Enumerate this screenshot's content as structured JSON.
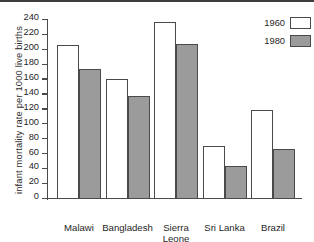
{
  "chart_data": {
    "type": "bar",
    "title": "",
    "xlabel": "",
    "ylabel": "infant mortality rate per 1000 live births",
    "ylim": [
      0,
      240
    ],
    "yticks": [
      0,
      20,
      40,
      60,
      80,
      100,
      120,
      140,
      160,
      180,
      200,
      220,
      240
    ],
    "grid": false,
    "legend_position": "top-right",
    "categories": [
      "Malawi",
      "Bangladesh",
      "Sierra\nLeone",
      "Sri Lanka",
      "Brazil"
    ],
    "series": [
      {
        "name": "1960",
        "color": "#ffffff",
        "values": [
          207,
          161,
          237,
          71,
          119
        ]
      },
      {
        "name": "1980",
        "color": "#9b9b9b",
        "values": [
          174,
          138,
          208,
          44,
          67
        ]
      }
    ]
  },
  "legend": {
    "items": [
      {
        "label": "1960",
        "swatch": "white-swatch"
      },
      {
        "label": "1980",
        "swatch": "gray-swatch"
      }
    ]
  },
  "colors": {
    "axis": "#4a4a4a",
    "bar_1960": "#ffffff",
    "bar_1980": "#9b9b9b",
    "background": "#ffffff",
    "text": "#1f1f1f"
  }
}
